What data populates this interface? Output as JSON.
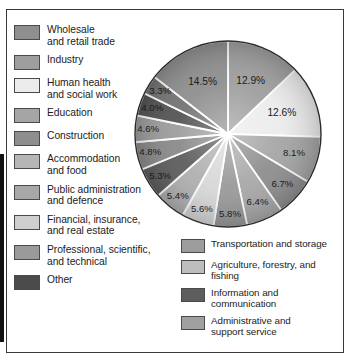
{
  "figure": {
    "kind": "pie-chart-with-legend"
  },
  "chart_data": {
    "type": "pie",
    "title": "",
    "legend_position": "left-and-bottom-right",
    "grid": false,
    "unit": "%",
    "categories": [
      "Wholesale and retail trade",
      "Industry",
      "Human health and social work",
      "Education",
      "Construction",
      "Accommodation and food",
      "Public administration and defence",
      "Financial, insurance, and real estate",
      "Professional, scientific, and technical",
      "Other",
      "Transportation and storage",
      "Agriculture, forestry, and fishing",
      "Information and communication",
      "Administrative and support service"
    ],
    "values": [
      14.5,
      12.9,
      12.6,
      8.1,
      6.7,
      6.4,
      5.8,
      5.6,
      5.4,
      5.3,
      4.8,
      4.6,
      4.0,
      3.3
    ],
    "labels": [
      "14.5%",
      "12.9%",
      "12.6%",
      "8.1%",
      "6.7%",
      "6.4%",
      "5.8%",
      "5.6%",
      "5.4%",
      "5.3%",
      "4.8%",
      "4.6%",
      "4.0%",
      "3.3%"
    ],
    "slice_order_clockwise_from_top": [
      {
        "label": "12.9%",
        "value": 12.9,
        "color": "#9e9e9e"
      },
      {
        "label": "12.6%",
        "value": 12.6,
        "color": "#ececec"
      },
      {
        "label": "8.1%",
        "value": 8.1,
        "color": "#a5a5a5"
      },
      {
        "label": "6.7%",
        "value": 6.7,
        "color": "#8e8e8e"
      },
      {
        "label": "6.4%",
        "value": 6.4,
        "color": "#a8a8a8"
      },
      {
        "label": "5.8%",
        "value": 5.8,
        "color": "#9a9a9a"
      },
      {
        "label": "5.6%",
        "value": 5.6,
        "color": "#d8d8d8"
      },
      {
        "label": "5.4%",
        "value": 5.4,
        "color": "#b0b0b0"
      },
      {
        "label": "5.3%",
        "value": 5.3,
        "color": "#5d5d5d"
      },
      {
        "label": "4.8%",
        "value": 4.8,
        "color": "#8a8a8a"
      },
      {
        "label": "4.6%",
        "value": 4.6,
        "color": "#9d9d9d"
      },
      {
        "label": "4.0%",
        "value": 4.0,
        "color": "#545454"
      },
      {
        "label": "3.3%",
        "value": 3.3,
        "color": "#747474"
      },
      {
        "label": "14.5%",
        "value": 14.5,
        "color": "#8f8f8f"
      }
    ]
  },
  "legend": {
    "left_column": [
      {
        "label": "Wholesale\nand retail trade",
        "color": "#8f8f8f"
      },
      {
        "label": "Industry",
        "color": "#9e9e9e"
      },
      {
        "label": "Human health\nand social work",
        "color": "#ececec"
      },
      {
        "label": "Education",
        "color": "#a5a5a5"
      },
      {
        "label": "Construction",
        "color": "#8e8e8e"
      },
      {
        "label": "Accommodation\nand food",
        "color": "#b6b6b6"
      },
      {
        "label": "Public administration\nand defence",
        "color": "#a8a8a8"
      },
      {
        "label": "Financial, insurance,\nand real estate",
        "color": "#cfcfcf"
      },
      {
        "label": "Professional, scientific,\nand technical",
        "color": "#9a9a9a"
      },
      {
        "label": "Other",
        "color": "#4b4b4b"
      }
    ],
    "right_column": [
      {
        "label": "Transportation and storage",
        "color": "#9d9d9d"
      },
      {
        "label": "Agriculture, forestry, and\nfishing",
        "color": "#bdbdbd"
      },
      {
        "label": "Information and\ncommunication",
        "color": "#5d5d5d"
      },
      {
        "label": "Administrative and\nsupport service",
        "color": "#a0a0a0"
      }
    ]
  }
}
